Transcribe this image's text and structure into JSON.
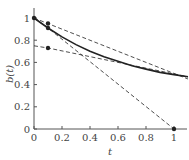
{
  "chart_data": {
    "type": "line",
    "title": "",
    "xlabel": "t",
    "ylabel": "b(t)",
    "xlim": [
      0,
      1.1
    ],
    "ylim": [
      0,
      1.05
    ],
    "x_ticks": [
      "0",
      "0.2",
      "0.4",
      "0.6",
      "0.8",
      "1"
    ],
    "y_ticks": [
      "0",
      "0.2",
      "0.4",
      "0.6",
      "0.8",
      "1"
    ],
    "grid": false,
    "legend": null,
    "series": [
      {
        "name": "b(t) curve",
        "style": "solid",
        "x": [
          0,
          0.1,
          0.2,
          0.3,
          0.4,
          0.5,
          0.6,
          0.7,
          0.8,
          0.9,
          1.0,
          1.1
        ],
        "y": [
          1.0,
          0.91,
          0.83,
          0.76,
          0.7,
          0.65,
          0.61,
          0.57,
          0.54,
          0.51,
          0.49,
          0.47
        ]
      },
      {
        "name": "tangent steep",
        "style": "dashed",
        "x": [
          0,
          0.1,
          1.0
        ],
        "y": [
          1.0,
          0.91,
          0.0
        ]
      },
      {
        "name": "upper chord",
        "style": "dashed",
        "x": [
          0,
          0.1,
          1.1
        ],
        "y": [
          1.0,
          0.95,
          0.45
        ]
      },
      {
        "name": "lower line",
        "style": "dashed",
        "x": [
          0,
          0.1,
          1.1
        ],
        "y": [
          0.75,
          0.73,
          0.47
        ]
      }
    ],
    "markers": [
      {
        "x": 0,
        "y": 1.0
      },
      {
        "x": 0.1,
        "y": 0.91
      },
      {
        "x": 0.1,
        "y": 0.95
      },
      {
        "x": 0.1,
        "y": 0.73
      },
      {
        "x": 1.0,
        "y": 0.0
      }
    ]
  },
  "colors": {
    "line": "#222222",
    "axis": "#555555",
    "text": "#444444"
  }
}
